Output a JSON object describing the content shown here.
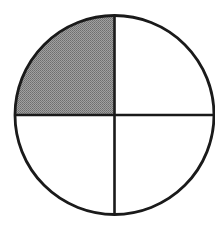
{
  "figure": {
    "shape": "circle",
    "parts_total": 4,
    "parts_shaded": 1,
    "fraction_shaded": "1/4",
    "shaded_quadrant": "top-left",
    "geometry": {
      "cx": 114.5,
      "cy": 115,
      "r": 99.5
    },
    "colors": {
      "stroke": "#1a1a1a",
      "shade": "#8a8a8a",
      "background": "#ffffff"
    },
    "quadrants": [
      {
        "position": "top-left",
        "shaded": true
      },
      {
        "position": "top-right",
        "shaded": false
      },
      {
        "position": "bottom-left",
        "shaded": false
      },
      {
        "position": "bottom-right",
        "shaded": false
      }
    ]
  }
}
